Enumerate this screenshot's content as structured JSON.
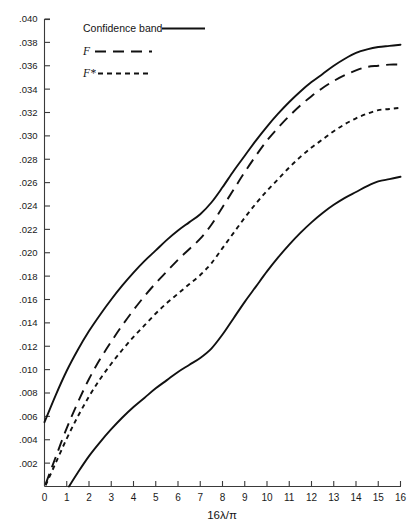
{
  "chart_data": {
    "type": "line",
    "title": "",
    "xlabel": "16λ/π",
    "ylabel": "",
    "xlim": [
      0,
      16
    ],
    "ylim": [
      0,
      0.04
    ],
    "grid": false,
    "legend_position": "top-left",
    "x_ticks": [
      "0",
      "1",
      "2",
      "3",
      "4",
      "5",
      "6",
      "7",
      "8",
      "9",
      "10",
      "11",
      "12",
      "13",
      "14",
      "15",
      "16"
    ],
    "x_tick_values": [
      0,
      1,
      2,
      3,
      4,
      5,
      6,
      7,
      8,
      9,
      10,
      11,
      12,
      13,
      14,
      15,
      16
    ],
    "y_ticks": [
      ".040",
      ".038",
      ".036",
      ".034",
      ".032",
      ".030",
      ".028",
      ".026",
      ".024",
      ".022",
      ".020",
      ".018",
      ".016",
      ".014",
      ".012",
      ".010",
      ".008",
      ".006",
      ".004",
      ".002"
    ],
    "y_tick_values": [
      0.04,
      0.038,
      0.036,
      0.034,
      0.032,
      0.03,
      0.028,
      0.026,
      0.024,
      0.022,
      0.02,
      0.018,
      0.016,
      0.014,
      0.012,
      0.01,
      0.008,
      0.006,
      0.004,
      0.002
    ],
    "legend": [
      {
        "label": "Confidence band",
        "style": "solid"
      },
      {
        "label": "F",
        "style": "long-dash"
      },
      {
        "label": "F*",
        "style": "short-dash"
      }
    ],
    "series": [
      {
        "name": "Confidence band upper",
        "style": "solid",
        "x": [
          0,
          0.5,
          1,
          1.5,
          2,
          2.5,
          3,
          3.5,
          4,
          4.5,
          5,
          5.5,
          6,
          6.5,
          7,
          7.5,
          8,
          8.5,
          9,
          9.5,
          10,
          10.5,
          11,
          11.5,
          12,
          12.5,
          13,
          13.5,
          14,
          14.5,
          15,
          15.5,
          16
        ],
        "values": [
          0.0055,
          0.0078,
          0.0099,
          0.0117,
          0.0133,
          0.0147,
          0.016,
          0.0172,
          0.0183,
          0.0193,
          0.0202,
          0.0211,
          0.0219,
          0.0226,
          0.0233,
          0.0243,
          0.0256,
          0.027,
          0.0283,
          0.0296,
          0.0308,
          0.0319,
          0.0329,
          0.0338,
          0.0346,
          0.0353,
          0.036,
          0.0366,
          0.0371,
          0.0374,
          0.0376,
          0.0377,
          0.0378
        ]
      },
      {
        "name": "Confidence band lower",
        "style": "solid",
        "x": [
          1.1,
          1.5,
          2,
          2.5,
          3,
          3.5,
          4,
          4.5,
          5,
          5.5,
          6,
          6.5,
          7,
          7.5,
          8,
          8.5,
          9,
          9.5,
          10,
          10.5,
          11,
          11.5,
          12,
          12.5,
          13,
          13.5,
          14,
          14.5,
          15,
          15.5,
          16
        ],
        "values": [
          0.0,
          0.0012,
          0.0026,
          0.0038,
          0.0049,
          0.0059,
          0.0068,
          0.0076,
          0.0084,
          0.0091,
          0.0098,
          0.0104,
          0.011,
          0.0118,
          0.013,
          0.0144,
          0.0158,
          0.0171,
          0.0184,
          0.0196,
          0.0207,
          0.0217,
          0.0226,
          0.0234,
          0.0241,
          0.0247,
          0.0252,
          0.0257,
          0.0261,
          0.0263,
          0.0265
        ]
      },
      {
        "name": "F",
        "style": "long-dash",
        "x": [
          0.05,
          0.5,
          1,
          1.5,
          2,
          2.5,
          3,
          3.5,
          4,
          4.5,
          5,
          5.5,
          6,
          6.5,
          7,
          7.5,
          8,
          8.5,
          9,
          9.5,
          10,
          10.5,
          11,
          11.5,
          12,
          12.5,
          13,
          13.5,
          14,
          14.5,
          15,
          15.5,
          16
        ],
        "values": [
          0.0002,
          0.0025,
          0.005,
          0.0072,
          0.0092,
          0.0109,
          0.0124,
          0.0138,
          0.0151,
          0.0163,
          0.0174,
          0.0184,
          0.0194,
          0.0203,
          0.0212,
          0.0224,
          0.0239,
          0.0254,
          0.0269,
          0.0283,
          0.0296,
          0.0307,
          0.0317,
          0.0326,
          0.0334,
          0.0341,
          0.0347,
          0.0352,
          0.0356,
          0.0359,
          0.036,
          0.0361,
          0.0361
        ]
      },
      {
        "name": "F*",
        "style": "short-dash",
        "x": [
          0.05,
          0.5,
          1,
          1.5,
          2,
          2.5,
          3,
          3.5,
          4,
          4.5,
          5,
          5.5,
          6,
          6.5,
          7,
          7.5,
          8,
          8.5,
          9,
          9.5,
          10,
          10.5,
          11,
          11.5,
          12,
          12.5,
          13,
          13.5,
          14,
          14.5,
          15,
          15.5,
          16
        ],
        "values": [
          0.0001,
          0.002,
          0.0041,
          0.006,
          0.0077,
          0.0092,
          0.0105,
          0.0117,
          0.0128,
          0.0138,
          0.0148,
          0.0157,
          0.0165,
          0.0173,
          0.0181,
          0.0191,
          0.0204,
          0.0217,
          0.023,
          0.0242,
          0.0253,
          0.0263,
          0.0273,
          0.0282,
          0.029,
          0.0297,
          0.0304,
          0.031,
          0.0315,
          0.0319,
          0.0322,
          0.0323,
          0.0324
        ]
      }
    ]
  },
  "colors": {
    "ink": "#111111",
    "axis": "#3a3a3a",
    "background": "#ffffff"
  }
}
